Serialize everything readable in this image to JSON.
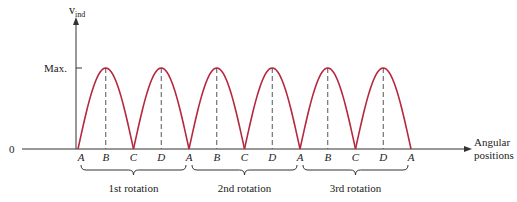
{
  "diagram": {
    "y_axis_label": "v",
    "y_axis_label_sub": "ind",
    "max_label": "Max.",
    "zero_label": "0",
    "x_axis_label_line1": "Angular",
    "x_axis_label_line2": "positions",
    "points": [
      "A",
      "B",
      "C",
      "D",
      "A",
      "B",
      "C",
      "D",
      "A",
      "B",
      "C",
      "D",
      "A"
    ],
    "rotations": [
      "1st rotation",
      "2nd rotation",
      "3rd rotation"
    ],
    "curve_color": "#b5283f",
    "axis_color": "#333333",
    "dash_color": "#555555",
    "arch_count": 6
  }
}
